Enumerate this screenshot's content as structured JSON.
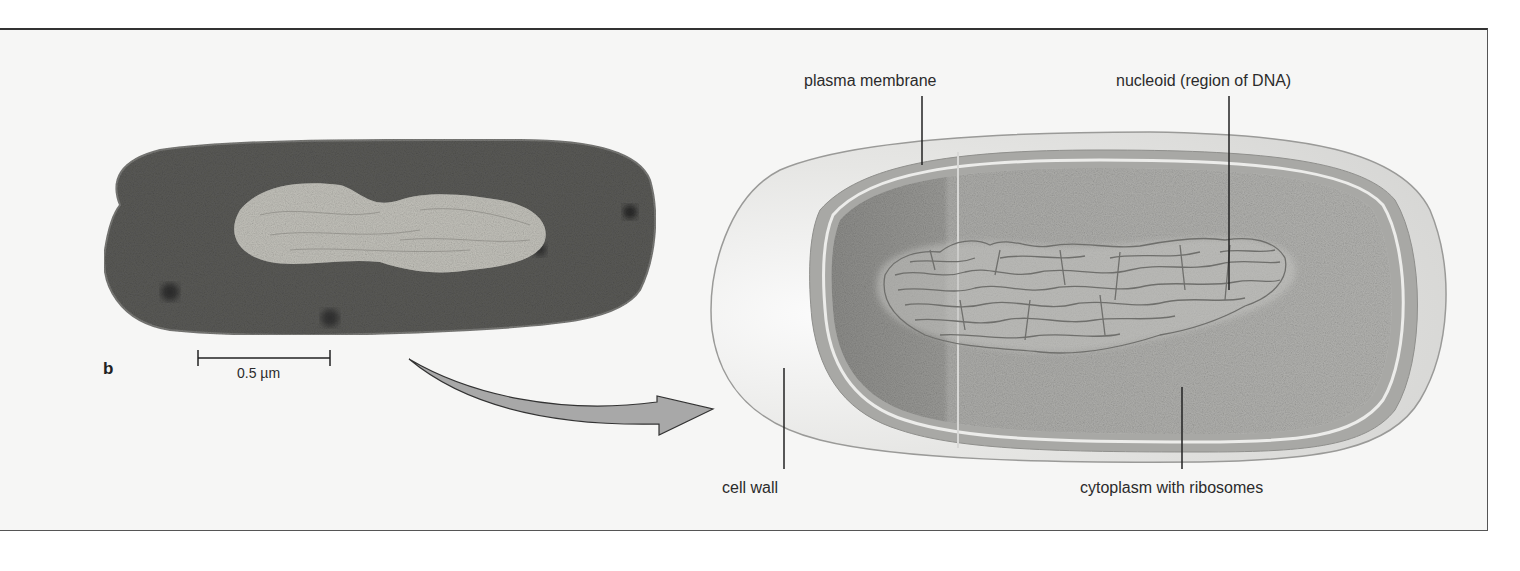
{
  "figure": {
    "panel_letter": "b",
    "scale_bar": {
      "label": "0.5 µm"
    },
    "micrograph": {
      "subject": "bacterial cell electron micrograph"
    },
    "arrow": {
      "direction": "micrograph-to-illustration"
    },
    "illustration": {
      "labels": {
        "plasma_membrane": "plasma membrane",
        "nucleoid": "nucleoid (region of DNA)",
        "cell_wall": "cell wall",
        "cytoplasm": "cytoplasm with ribosomes"
      }
    },
    "colors": {
      "background": "#f6f6f5",
      "micrograph_dark": "#4a4a48",
      "micrograph_light": "#b9b8b2",
      "cell_wall_fill": "#e4e4e2",
      "membrane_band": "#a9a9a6",
      "cytoplasm": "#9f9f9c",
      "dna_line": "#6f6f6c",
      "arrow_fill": "#a8a8a8",
      "text": "#2b2b2b"
    }
  }
}
